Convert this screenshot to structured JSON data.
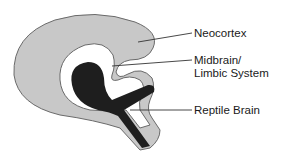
{
  "diagram": {
    "labels": [
      {
        "id": "neocortex",
        "text": "Neocortex"
      },
      {
        "id": "midbrain",
        "line1": "Midbrain/",
        "line2": "Limbic System"
      },
      {
        "id": "reptile",
        "text": "Reptile Brain"
      }
    ],
    "colors": {
      "neocortex_fill": "#c8c8c8",
      "outline": "#6a6a6a",
      "midbrain_fill": "#ffffff",
      "reptile_fill": "#1e1e1e",
      "leader_line": "#333333"
    }
  }
}
